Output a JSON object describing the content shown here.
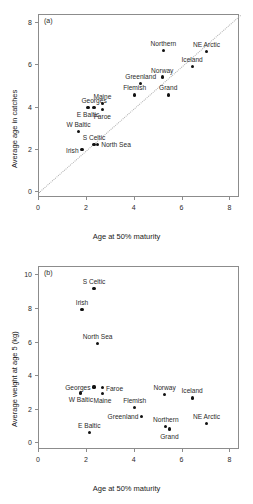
{
  "figure": {
    "width": 253,
    "height": 504,
    "background": "#ffffff",
    "point_color": "#111111",
    "axis_color": "#8c8c8c",
    "refline_color": "#b0b0b0"
  },
  "chart_data": [
    {
      "type": "scatter",
      "panel_tag": "(a)",
      "title": "",
      "xlabel": "Age at 50% maturity",
      "ylabel": "Average age in catches",
      "xlim": [
        0,
        8.4
      ],
      "ylim": [
        -0.3,
        8.4
      ],
      "xticks": [
        0,
        2,
        4,
        6,
        8
      ],
      "yticks": [
        0,
        2,
        4,
        6,
        8
      ],
      "xticklabels": [
        "0",
        "2",
        "4",
        "6",
        "8"
      ],
      "yticklabels": [
        "0",
        "2",
        "4",
        "6",
        "8"
      ],
      "grid": false,
      "legend": "none",
      "annotations": [
        {
          "text": "y = x reference line",
          "style": "dotted",
          "from": [
            0,
            0
          ],
          "to": [
            8.4,
            8.4
          ]
        }
      ],
      "points": [
        {
          "label": "Irish",
          "x": 1.8,
          "y": 2.0,
          "label_pos": "left"
        },
        {
          "label": "S Celtic",
          "x": 2.3,
          "y": 2.25,
          "label_pos": "above"
        },
        {
          "label": "W Baltic",
          "x": 1.65,
          "y": 2.85,
          "label_pos": "above"
        },
        {
          "label": "North Sea",
          "x": 2.45,
          "y": 2.25,
          "label_pos": "right"
        },
        {
          "label": "E Baltic",
          "x": 2.05,
          "y": 4.0,
          "label_pos": "below"
        },
        {
          "label": "Georges",
          "x": 2.3,
          "y": 4.0,
          "label_pos": "above"
        },
        {
          "label": "Faroe",
          "x": 2.65,
          "y": 3.9,
          "label_pos": "below"
        },
        {
          "label": "Maine",
          "x": 2.65,
          "y": 4.2,
          "label_pos": "above"
        },
        {
          "label": "Flemish",
          "x": 4.0,
          "y": 4.6,
          "label_pos": "above"
        },
        {
          "label": "Greenland",
          "x": 4.25,
          "y": 5.15,
          "label_pos": "above"
        },
        {
          "label": "Grand",
          "x": 5.4,
          "y": 4.6,
          "label_pos": "above"
        },
        {
          "label": "Norway",
          "x": 5.15,
          "y": 5.45,
          "label_pos": "above"
        },
        {
          "label": "Northern",
          "x": 5.2,
          "y": 6.7,
          "label_pos": "above"
        },
        {
          "label": "Iceland",
          "x": 6.4,
          "y": 5.95,
          "label_pos": "above"
        },
        {
          "label": "NE Arctic",
          "x": 7.0,
          "y": 6.65,
          "label_pos": "above"
        }
      ]
    },
    {
      "type": "scatter",
      "panel_tag": "(b)",
      "title": "",
      "xlabel": "Age at 50% maturity",
      "ylabel": "Average weight at age 5  (kg)",
      "xlim": [
        0,
        8.4
      ],
      "ylim": [
        -0.4,
        10.5
      ],
      "xticks": [
        0,
        2,
        4,
        6,
        8
      ],
      "yticks": [
        0,
        2,
        4,
        6,
        8,
        10
      ],
      "xticklabels": [
        "0",
        "2",
        "4",
        "6",
        "8"
      ],
      "yticklabels": [
        "0",
        "2",
        "4",
        "6",
        "8",
        "10"
      ],
      "grid": false,
      "legend": "none",
      "annotations": [],
      "points": [
        {
          "label": "S Celtic",
          "x": 2.3,
          "y": 9.2,
          "label_pos": "above"
        },
        {
          "label": "Irish",
          "x": 1.8,
          "y": 7.95,
          "label_pos": "above"
        },
        {
          "label": "North Sea",
          "x": 2.45,
          "y": 5.95,
          "label_pos": "above"
        },
        {
          "label": "Georges",
          "x": 2.3,
          "y": 3.35,
          "label_pos": "left"
        },
        {
          "label": "Faroe",
          "x": 2.65,
          "y": 3.3,
          "label_pos": "right"
        },
        {
          "label": "W Baltic",
          "x": 1.75,
          "y": 3.0,
          "label_pos": "below"
        },
        {
          "label": "Maine",
          "x": 2.65,
          "y": 2.95,
          "label_pos": "below"
        },
        {
          "label": "Norway",
          "x": 5.25,
          "y": 2.9,
          "label_pos": "above"
        },
        {
          "label": "Iceland",
          "x": 6.4,
          "y": 2.7,
          "label_pos": "above"
        },
        {
          "label": "Flemish",
          "x": 4.0,
          "y": 2.15,
          "label_pos": "above"
        },
        {
          "label": "Greenland",
          "x": 4.3,
          "y": 1.6,
          "label_pos": "left"
        },
        {
          "label": "NE Arctic",
          "x": 7.0,
          "y": 1.2,
          "label_pos": "above"
        },
        {
          "label": "Northern",
          "x": 5.3,
          "y": 1.0,
          "label_pos": "above"
        },
        {
          "label": "Grand",
          "x": 5.45,
          "y": 0.85,
          "label_pos": "below"
        },
        {
          "label": "E Baltic",
          "x": 2.1,
          "y": 0.65,
          "label_pos": "above"
        }
      ]
    }
  ]
}
